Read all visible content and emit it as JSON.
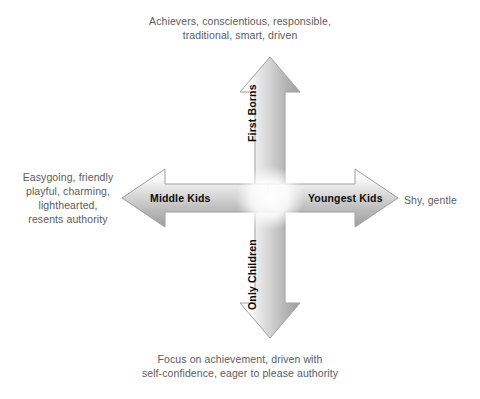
{
  "diagram": {
    "background_color": "#ffffff",
    "text_color": "#5b5b5b",
    "label_color": "#0d0d0d",
    "arrow_fill_light": "#fdfdfd",
    "arrow_fill_mid": "#d7d7d7",
    "arrow_fill_dark": "#8e8e8e",
    "arrow_stroke": "#9a9a9a"
  },
  "descriptions": {
    "top": "Achievers, conscientious, responsible,\ntraditional, smart, driven",
    "bottom": "Focus on achievement, driven with\nself-confidence, eager to please authority",
    "left": "Easygoing, friendly\nplayful, charming,\nlighthearted,\nresents authority",
    "right": "Shy, gentle"
  },
  "arrows": {
    "up": {
      "label": "First Borns",
      "direction": "up",
      "tip": {
        "x": 270,
        "y": 57
      },
      "tail": {
        "x": 270,
        "y": 198
      }
    },
    "down": {
      "label": "Only Children",
      "direction": "down",
      "tip": {
        "x": 270,
        "y": 338
      },
      "tail": {
        "x": 270,
        "y": 198
      }
    },
    "left": {
      "label": "Middle Kids",
      "direction": "left",
      "tip": {
        "x": 122,
        "y": 198
      },
      "tail": {
        "x": 270,
        "y": 198
      }
    },
    "right": {
      "label": "Youngest Kids",
      "direction": "right",
      "tip": {
        "x": 398,
        "y": 198
      },
      "tail": {
        "x": 270,
        "y": 198
      }
    }
  }
}
